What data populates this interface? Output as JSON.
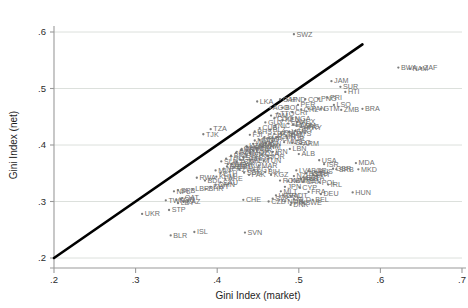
{
  "chart_data": {
    "type": "scatter",
    "title": "",
    "xlabel": "Gini Index (market)",
    "ylabel": "Gini Index (net)",
    "xlim": [
      0.2,
      0.7
    ],
    "ylim": [
      0.2,
      0.6
    ],
    "xticks": [
      ".2",
      ".3",
      ".4",
      ".5",
      ".6",
      ".7"
    ],
    "yticks": [
      ".2",
      ".3",
      ".4",
      ".5",
      ".6"
    ],
    "xtick_values": [
      0.2,
      0.3,
      0.4,
      0.5,
      0.6,
      0.7
    ],
    "ytick_values": [
      0.2,
      0.3,
      0.4,
      0.5,
      0.6
    ],
    "grid": "horizontal",
    "legend": "none",
    "marker_color": "#7d7d7d",
    "label_color": "#6f6f6f",
    "reference_line": {
      "name": "45-degree identity line",
      "color": "#000000",
      "x0": 0.2,
      "y0": 0.2,
      "x1": 0.578,
      "y1": 0.578
    },
    "points": [
      {
        "label": "SWZ",
        "x": 0.494,
        "y": 0.596
      },
      {
        "label": "BWA",
        "x": 0.622,
        "y": 0.537
      },
      {
        "label": "NAM",
        "x": 0.636,
        "y": 0.535
      },
      {
        "label": "ZAF",
        "x": 0.65,
        "y": 0.536
      },
      {
        "label": "JAM",
        "x": 0.54,
        "y": 0.513
      },
      {
        "label": "SUR",
        "x": 0.551,
        "y": 0.503
      },
      {
        "label": "HTI",
        "x": 0.557,
        "y": 0.494
      },
      {
        "label": "PNG",
        "x": 0.524,
        "y": 0.482
      },
      {
        "label": "PRI",
        "x": 0.535,
        "y": 0.484
      },
      {
        "label": "COL",
        "x": 0.508,
        "y": 0.481
      },
      {
        "label": "CAF",
        "x": 0.477,
        "y": 0.481
      },
      {
        "label": "HND",
        "x": 0.486,
        "y": 0.48
      },
      {
        "label": "LKA",
        "x": 0.449,
        "y": 0.477
      },
      {
        "label": "PER",
        "x": 0.499,
        "y": 0.471
      },
      {
        "label": "LSO",
        "x": 0.543,
        "y": 0.471
      },
      {
        "label": "BRA",
        "x": 0.578,
        "y": 0.464
      },
      {
        "label": "BOL",
        "x": 0.48,
        "y": 0.466
      },
      {
        "label": "AGO",
        "x": 0.465,
        "y": 0.466
      },
      {
        "label": "PAN",
        "x": 0.512,
        "y": 0.464
      },
      {
        "label": "GTM",
        "x": 0.527,
        "y": 0.464
      },
      {
        "label": "CHL",
        "x": 0.503,
        "y": 0.463
      },
      {
        "label": "ZMB",
        "x": 0.552,
        "y": 0.462
      },
      {
        "label": "CRI",
        "x": 0.492,
        "y": 0.458
      },
      {
        "label": "TZA",
        "x": 0.392,
        "y": 0.428
      },
      {
        "label": "TJK",
        "x": 0.383,
        "y": 0.419
      },
      {
        "label": "COG",
        "x": 0.47,
        "y": 0.447
      },
      {
        "label": "NGA",
        "x": 0.492,
        "y": 0.447
      },
      {
        "label": "KEN",
        "x": 0.48,
        "y": 0.444
      },
      {
        "label": "MEX",
        "x": 0.498,
        "y": 0.441
      },
      {
        "label": "SLV",
        "x": 0.487,
        "y": 0.438
      },
      {
        "label": "ECU",
        "x": 0.493,
        "y": 0.436
      },
      {
        "label": "DOM",
        "x": 0.497,
        "y": 0.434
      },
      {
        "label": "ARG",
        "x": 0.503,
        "y": 0.432
      },
      {
        "label": "PRY",
        "x": 0.507,
        "y": 0.43
      },
      {
        "label": "URY",
        "x": 0.496,
        "y": 0.425
      },
      {
        "label": "VEN",
        "x": 0.488,
        "y": 0.423
      },
      {
        "label": "PHL",
        "x": 0.478,
        "y": 0.421
      },
      {
        "label": "MYS",
        "x": 0.493,
        "y": 0.42
      },
      {
        "label": "THA",
        "x": 0.485,
        "y": 0.416
      },
      {
        "label": "CHN",
        "x": 0.474,
        "y": 0.414
      },
      {
        "label": "TUR",
        "x": 0.486,
        "y": 0.412
      },
      {
        "label": "GEO",
        "x": 0.492,
        "y": 0.404
      },
      {
        "label": "ARM",
        "x": 0.502,
        "y": 0.402
      },
      {
        "label": "MUS",
        "x": 0.482,
        "y": 0.405
      },
      {
        "label": "IDN",
        "x": 0.46,
        "y": 0.403
      },
      {
        "label": "IND",
        "x": 0.452,
        "y": 0.4
      },
      {
        "label": "VNM",
        "x": 0.455,
        "y": 0.397
      },
      {
        "label": "LBN",
        "x": 0.489,
        "y": 0.393
      },
      {
        "label": "ALB",
        "x": 0.5,
        "y": 0.384
      },
      {
        "label": "USA",
        "x": 0.525,
        "y": 0.373
      },
      {
        "label": "ISR",
        "x": 0.531,
        "y": 0.366
      },
      {
        "label": "MDA",
        "x": 0.57,
        "y": 0.368
      },
      {
        "label": "MKD",
        "x": 0.573,
        "y": 0.357
      },
      {
        "label": "GBR",
        "x": 0.542,
        "y": 0.358
      },
      {
        "label": "SRB",
        "x": 0.546,
        "y": 0.357
      },
      {
        "label": "LVA",
        "x": 0.497,
        "y": 0.355
      },
      {
        "label": "BGR",
        "x": 0.512,
        "y": 0.354
      },
      {
        "label": "RUS",
        "x": 0.52,
        "y": 0.353
      },
      {
        "label": "LTU",
        "x": 0.517,
        "y": 0.349
      },
      {
        "label": "EST",
        "x": 0.509,
        "y": 0.35
      },
      {
        "label": "PRT",
        "x": 0.518,
        "y": 0.347
      },
      {
        "label": "KGZ",
        "x": 0.466,
        "y": 0.347
      },
      {
        "label": "NZL",
        "x": 0.494,
        "y": 0.345
      },
      {
        "label": "ESP",
        "x": 0.506,
        "y": 0.343
      },
      {
        "label": "ITA",
        "x": 0.515,
        "y": 0.342
      },
      {
        "label": "AUS",
        "x": 0.503,
        "y": 0.34
      },
      {
        "label": "ROM",
        "x": 0.477,
        "y": 0.337
      },
      {
        "label": "KSV",
        "x": 0.487,
        "y": 0.336
      },
      {
        "label": "MNE",
        "x": 0.497,
        "y": 0.336
      },
      {
        "label": "CAN",
        "x": 0.506,
        "y": 0.335
      },
      {
        "label": "POL",
        "x": 0.525,
        "y": 0.334
      },
      {
        "label": "IRL",
        "x": 0.536,
        "y": 0.33
      },
      {
        "label": "JPN",
        "x": 0.483,
        "y": 0.326
      },
      {
        "label": "CYP",
        "x": 0.501,
        "y": 0.325
      },
      {
        "label": "MLT",
        "x": 0.478,
        "y": 0.318
      },
      {
        "label": "FRA",
        "x": 0.512,
        "y": 0.317
      },
      {
        "label": "HUN",
        "x": 0.566,
        "y": 0.316
      },
      {
        "label": "DEU",
        "x": 0.527,
        "y": 0.313
      },
      {
        "label": "HRV",
        "x": 0.472,
        "y": 0.311
      },
      {
        "label": "GRC",
        "x": 0.481,
        "y": 0.311
      },
      {
        "label": "AUT",
        "x": 0.49,
        "y": 0.31
      },
      {
        "label": "SVK",
        "x": 0.468,
        "y": 0.305
      },
      {
        "label": "NLD",
        "x": 0.494,
        "y": 0.304
      },
      {
        "label": "BEL",
        "x": 0.517,
        "y": 0.303
      },
      {
        "label": "NOR",
        "x": 0.483,
        "y": 0.3
      },
      {
        "label": "SWE",
        "x": 0.505,
        "y": 0.298
      },
      {
        "label": "FIN",
        "x": 0.491,
        "y": 0.298
      },
      {
        "label": "DNK",
        "x": 0.49,
        "y": 0.294
      },
      {
        "label": "CZE",
        "x": 0.463,
        "y": 0.3
      },
      {
        "label": "CHE",
        "x": 0.432,
        "y": 0.303
      },
      {
        "label": "SVN",
        "x": 0.434,
        "y": 0.245
      },
      {
        "label": "ISL",
        "x": 0.372,
        "y": 0.246
      },
      {
        "label": "BLR",
        "x": 0.343,
        "y": 0.24
      },
      {
        "label": "UKR",
        "x": 0.308,
        "y": 0.278
      },
      {
        "label": "STP",
        "x": 0.341,
        "y": 0.285
      },
      {
        "label": "KAZ",
        "x": 0.359,
        "y": 0.3
      },
      {
        "label": "TWN",
        "x": 0.337,
        "y": 0.302
      },
      {
        "label": "LBY",
        "x": 0.352,
        "y": 0.297
      },
      {
        "label": "KOR",
        "x": 0.35,
        "y": 0.303
      },
      {
        "label": "QAT",
        "x": 0.357,
        "y": 0.306
      },
      {
        "label": "NPL",
        "x": 0.347,
        "y": 0.318
      },
      {
        "label": "SRB2",
        "x": 0.352,
        "y": 0.32
      },
      {
        "label": "LBR",
        "x": 0.37,
        "y": 0.322
      },
      {
        "label": "BDI",
        "x": 0.385,
        "y": 0.337
      },
      {
        "label": "RWA",
        "x": 0.375,
        "y": 0.342
      },
      {
        "label": "KHM",
        "x": 0.399,
        "y": 0.344
      },
      {
        "label": "ETH",
        "x": 0.404,
        "y": 0.35
      },
      {
        "label": "MLI",
        "x": 0.398,
        "y": 0.355
      },
      {
        "label": "NER",
        "x": 0.408,
        "y": 0.358
      },
      {
        "label": "BGD",
        "x": 0.412,
        "y": 0.362
      },
      {
        "label": "UGA",
        "x": 0.418,
        "y": 0.366
      },
      {
        "label": "TCD",
        "x": 0.424,
        "y": 0.37
      },
      {
        "label": "GHA",
        "x": 0.428,
        "y": 0.374
      },
      {
        "label": "SEN",
        "x": 0.432,
        "y": 0.378
      },
      {
        "label": "BEN",
        "x": 0.436,
        "y": 0.382
      },
      {
        "label": "MOZ",
        "x": 0.44,
        "y": 0.386
      },
      {
        "label": "CMR",
        "x": 0.444,
        "y": 0.39
      },
      {
        "label": "CIV",
        "x": 0.448,
        "y": 0.394
      },
      {
        "label": "MWI",
        "x": 0.437,
        "y": 0.396
      },
      {
        "label": "MRT",
        "x": 0.429,
        "y": 0.391
      },
      {
        "label": "GIN",
        "x": 0.423,
        "y": 0.386
      },
      {
        "label": "BFA",
        "x": 0.417,
        "y": 0.381
      },
      {
        "label": "TGO",
        "x": 0.411,
        "y": 0.376
      },
      {
        "label": "SLE",
        "x": 0.405,
        "y": 0.371
      },
      {
        "label": "GMB",
        "x": 0.413,
        "y": 0.366
      },
      {
        "label": "COD",
        "x": 0.421,
        "y": 0.361
      },
      {
        "label": "ZWE",
        "x": 0.427,
        "y": 0.356
      },
      {
        "label": "SDN",
        "x": 0.433,
        "y": 0.351
      },
      {
        "label": "PAK",
        "x": 0.439,
        "y": 0.347
      },
      {
        "label": "EGY",
        "x": 0.445,
        "y": 0.356
      },
      {
        "label": "MAR",
        "x": 0.451,
        "y": 0.364
      },
      {
        "label": "TUN",
        "x": 0.457,
        "y": 0.372
      },
      {
        "label": "JOR",
        "x": 0.462,
        "y": 0.38
      },
      {
        "label": "IRN",
        "x": 0.468,
        "y": 0.388
      },
      {
        "label": "DZA",
        "x": 0.455,
        "y": 0.384
      },
      {
        "label": "SYR",
        "x": 0.447,
        "y": 0.378
      },
      {
        "label": "YEM",
        "x": 0.441,
        "y": 0.372
      },
      {
        "label": "IRQ",
        "x": 0.435,
        "y": 0.366
      },
      {
        "label": "LAO",
        "x": 0.444,
        "y": 0.402
      },
      {
        "label": "MNG",
        "x": 0.452,
        "y": 0.409
      },
      {
        "label": "UZB",
        "x": 0.436,
        "y": 0.398
      },
      {
        "label": "TKM",
        "x": 0.43,
        "y": 0.393
      },
      {
        "label": "AZE",
        "x": 0.424,
        "y": 0.388
      },
      {
        "label": "BIH",
        "x": 0.459,
        "y": 0.352
      },
      {
        "label": "BLZ",
        "x": 0.465,
        "y": 0.427
      },
      {
        "label": "NIC",
        "x": 0.471,
        "y": 0.434
      },
      {
        "label": "GUY",
        "x": 0.459,
        "y": 0.44
      },
      {
        "label": "JAM2",
        "x": 0.466,
        "y": 0.452
      },
      {
        "label": "TTO",
        "x": 0.474,
        "y": 0.456
      },
      {
        "label": "CUB",
        "x": 0.452,
        "y": 0.43
      },
      {
        "label": "BHS",
        "x": 0.446,
        "y": 0.424
      },
      {
        "label": "FJI",
        "x": 0.44,
        "y": 0.418
      },
      {
        "label": "SGP",
        "x": 0.458,
        "y": 0.414
      },
      {
        "label": "HKG",
        "x": 0.47,
        "y": 0.42
      },
      {
        "label": "MAC",
        "x": 0.463,
        "y": 0.412
      },
      {
        "label": "ARE",
        "x": 0.41,
        "y": 0.34
      },
      {
        "label": "SAU",
        "x": 0.404,
        "y": 0.334
      },
      {
        "label": "OMN",
        "x": 0.398,
        "y": 0.33
      },
      {
        "label": "KWT",
        "x": 0.392,
        "y": 0.326
      },
      {
        "label": "BHR",
        "x": 0.386,
        "y": 0.322
      },
      {
        "label": "MDG",
        "x": 0.446,
        "y": 0.408
      },
      {
        "label": "SOM",
        "x": 0.452,
        "y": 0.398
      }
    ]
  },
  "axes": {
    "x_title": "Gini Index (market)",
    "y_title": "Gini Index (net)"
  }
}
